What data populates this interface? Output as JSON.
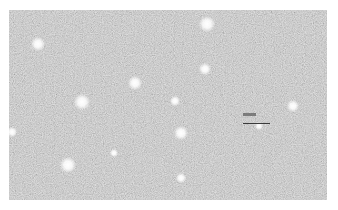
{
  "image": {
    "kind": "grayscale micrograph",
    "background_color": "#b4b4b4",
    "frame": {
      "left": 9,
      "top": 10,
      "width": 318,
      "height": 190
    },
    "bright_spots": [
      {
        "x": 29,
        "y": 34,
        "r": 7
      },
      {
        "x": 198,
        "y": 14,
        "r": 8
      },
      {
        "x": 196,
        "y": 59,
        "r": 6
      },
      {
        "x": 126,
        "y": 73,
        "r": 7
      },
      {
        "x": 73,
        "y": 92,
        "r": 8
      },
      {
        "x": 166,
        "y": 91,
        "r": 5
      },
      {
        "x": 284,
        "y": 96,
        "r": 6
      },
      {
        "x": 172,
        "y": 123,
        "r": 7
      },
      {
        "x": 59,
        "y": 155,
        "r": 8
      },
      {
        "x": 172,
        "y": 168,
        "r": 5
      },
      {
        "x": 3,
        "y": 122,
        "r": 5
      },
      {
        "x": 105,
        "y": 143,
        "r": 4
      },
      {
        "x": 250,
        "y": 116,
        "r": 4
      }
    ],
    "scale_bar": {
      "label_text": "",
      "label_box": {
        "x": 234,
        "y": 103,
        "width": 13,
        "height": 3
      },
      "bar": {
        "x": 234,
        "y": 113,
        "width": 27
      }
    }
  }
}
